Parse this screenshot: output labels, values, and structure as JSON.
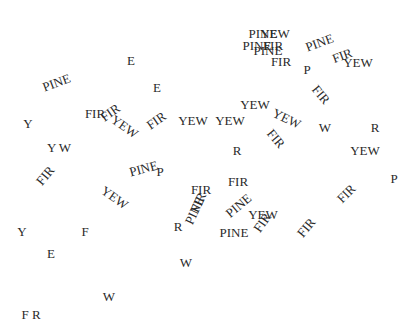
{
  "canvas": {
    "width": 415,
    "height": 329,
    "background": "#ffffff",
    "text_color": "#2a2a2a"
  },
  "words": [
    {
      "text": "E",
      "x": 131,
      "y": 60,
      "rot": 0
    },
    {
      "text": "PINE",
      "x": 56,
      "y": 82,
      "rot": -20
    },
    {
      "text": "E",
      "x": 157,
      "y": 87,
      "rot": 0
    },
    {
      "text": "FIR",
      "x": 95,
      "y": 113,
      "rot": 0
    },
    {
      "text": "FIR",
      "x": 110,
      "y": 112,
      "rot": -35
    },
    {
      "text": "YEW",
      "x": 125,
      "y": 126,
      "rot": 35
    },
    {
      "text": "FIR",
      "x": 156,
      "y": 120,
      "rot": -35
    },
    {
      "text": "YEW",
      "x": 193,
      "y": 120,
      "rot": 0
    },
    {
      "text": "Y",
      "x": 28,
      "y": 123,
      "rot": 0
    },
    {
      "text": "Y W",
      "x": 59,
      "y": 147,
      "rot": 0
    },
    {
      "text": "PINE",
      "x": 263,
      "y": 33,
      "rot": 0
    },
    {
      "text": "YEW",
      "x": 275,
      "y": 33,
      "rot": 0
    },
    {
      "text": "PINE",
      "x": 257,
      "y": 45,
      "rot": 0
    },
    {
      "text": "FIR",
      "x": 273,
      "y": 45,
      "rot": 0
    },
    {
      "text": "PINE",
      "x": 268,
      "y": 50,
      "rot": 0
    },
    {
      "text": "FIR",
      "x": 281,
      "y": 61,
      "rot": 0
    },
    {
      "text": "PINE",
      "x": 319,
      "y": 42,
      "rot": -20
    },
    {
      "text": "FIR",
      "x": 342,
      "y": 55,
      "rot": -20
    },
    {
      "text": "YEW",
      "x": 358,
      "y": 62,
      "rot": 0
    },
    {
      "text": "P",
      "x": 307,
      "y": 69,
      "rot": 0
    },
    {
      "text": "FIR",
      "x": 321,
      "y": 94,
      "rot": 50
    },
    {
      "text": "YEW",
      "x": 255,
      "y": 104,
      "rot": 0
    },
    {
      "text": "YEW",
      "x": 230,
      "y": 120,
      "rot": 0
    },
    {
      "text": "YEW",
      "x": 287,
      "y": 118,
      "rot": 25
    },
    {
      "text": "W",
      "x": 325,
      "y": 127,
      "rot": 0
    },
    {
      "text": "R",
      "x": 375,
      "y": 127,
      "rot": 0
    },
    {
      "text": "FIR",
      "x": 276,
      "y": 138,
      "rot": 50
    },
    {
      "text": "R",
      "x": 237,
      "y": 150,
      "rot": 0
    },
    {
      "text": "YEW",
      "x": 365,
      "y": 150,
      "rot": 0
    },
    {
      "text": "FIR",
      "x": 45,
      "y": 175,
      "rot": -50
    },
    {
      "text": "PINE",
      "x": 143,
      "y": 168,
      "rot": -15
    },
    {
      "text": "P",
      "x": 160,
      "y": 171,
      "rot": 0
    },
    {
      "text": "YEW",
      "x": 115,
      "y": 197,
      "rot": 35
    },
    {
      "text": "FIR",
      "x": 238,
      "y": 181,
      "rot": 0
    },
    {
      "text": "P",
      "x": 394,
      "y": 178,
      "rot": 0
    },
    {
      "text": "FIR",
      "x": 346,
      "y": 193,
      "rot": -45
    },
    {
      "text": "FIR",
      "x": 201,
      "y": 189,
      "rot": 0
    },
    {
      "text": "PINE",
      "x": 194,
      "y": 210,
      "rot": -65
    },
    {
      "text": "FIR",
      "x": 198,
      "y": 202,
      "rot": -65
    },
    {
      "text": "PINE",
      "x": 238,
      "y": 205,
      "rot": -40
    },
    {
      "text": "YEW",
      "x": 263,
      "y": 214,
      "rot": 0
    },
    {
      "text": "FIR",
      "x": 262,
      "y": 222,
      "rot": -55
    },
    {
      "text": "FIR",
      "x": 306,
      "y": 227,
      "rot": -50
    },
    {
      "text": "PINE",
      "x": 234,
      "y": 232,
      "rot": 0
    },
    {
      "text": "R",
      "x": 178,
      "y": 226,
      "rot": 0
    },
    {
      "text": "Y",
      "x": 22,
      "y": 231,
      "rot": 0
    },
    {
      "text": "F",
      "x": 85,
      "y": 231,
      "rot": 0
    },
    {
      "text": "E",
      "x": 51,
      "y": 253,
      "rot": 0
    },
    {
      "text": "W",
      "x": 186,
      "y": 262,
      "rot": 0
    },
    {
      "text": "W",
      "x": 109,
      "y": 296,
      "rot": 0
    },
    {
      "text": "F R",
      "x": 31,
      "y": 314,
      "rot": 0
    }
  ]
}
